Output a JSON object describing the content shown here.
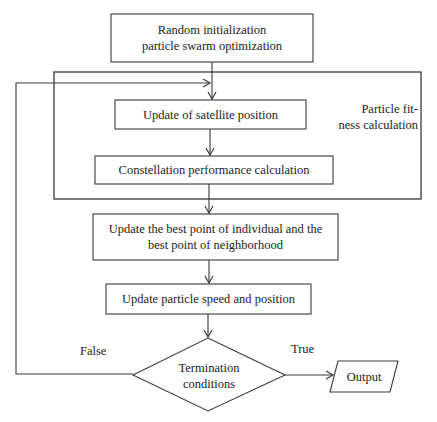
{
  "diagram": {
    "type": "flowchart",
    "colors": {
      "stroke": "#3a3a3a",
      "text": "#222222",
      "background": "#ffffff"
    },
    "nodes": [
      {
        "id": "init",
        "shape": "rectangle",
        "label": "Random initialization\nparticle swarm optimization"
      },
      {
        "id": "satellite",
        "shape": "rectangle",
        "label": "Update of satellite position"
      },
      {
        "id": "constellation",
        "shape": "rectangle",
        "label": "Constellation performance calculation"
      },
      {
        "id": "best",
        "shape": "rectangle",
        "label": "Update the best point of individual and the\nbest point of neighborhood"
      },
      {
        "id": "speed",
        "shape": "rectangle",
        "label": "Update particle speed and position"
      },
      {
        "id": "termination",
        "shape": "diamond",
        "label": "Termination\nconditions"
      },
      {
        "id": "output",
        "shape": "parallelogram",
        "label": "Output"
      }
    ],
    "group": {
      "id": "fitness-group",
      "label": "Particle fit-\nness calculation",
      "contains": [
        "satellite",
        "constellation"
      ]
    },
    "edges": [
      {
        "from": "init",
        "to": "satellite"
      },
      {
        "from": "satellite",
        "to": "constellation"
      },
      {
        "from": "constellation",
        "to": "best"
      },
      {
        "from": "best",
        "to": "speed"
      },
      {
        "from": "speed",
        "to": "termination"
      },
      {
        "from": "termination",
        "to": "output",
        "label": "True"
      },
      {
        "from": "termination",
        "to": "satellite",
        "label": "False"
      }
    ],
    "edge_labels": {
      "false": "False",
      "true": "True"
    }
  }
}
